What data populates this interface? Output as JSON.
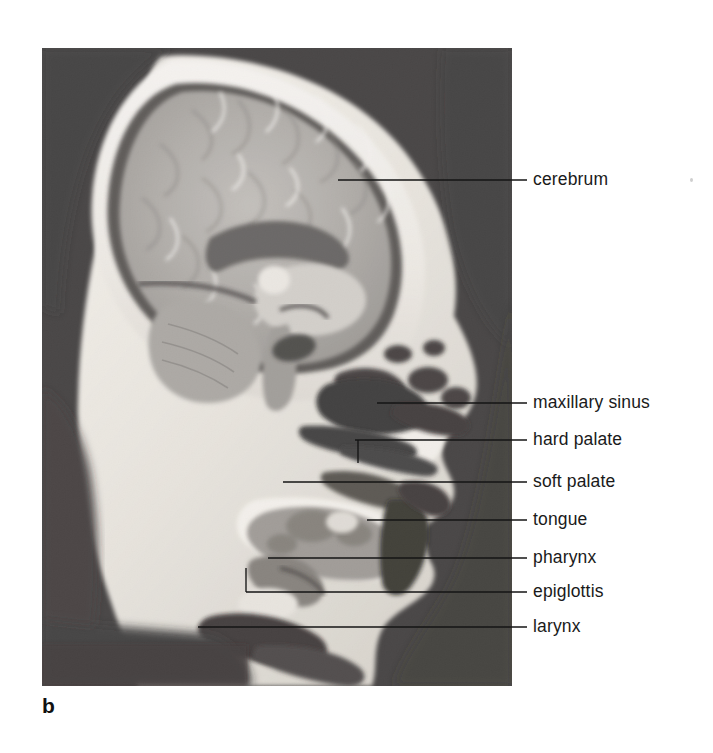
{
  "figure": {
    "panel_letter": "b",
    "caption_present": false,
    "image_kind": "grayscale-photograph",
    "background_color": "#ffffff",
    "ink_color": "#1a1a1a",
    "photo_bounds": {
      "left": 42,
      "top": 48,
      "width": 470,
      "height": 638
    }
  },
  "labels": [
    {
      "key": "cerebrum",
      "text": "cerebrum",
      "text_x": 533,
      "text_y": 170,
      "dash_x1": 512,
      "dash_x2": 527,
      "leader_y": 180,
      "leader_x_start": 338,
      "leader_style": "straight"
    },
    {
      "key": "maxillary-sinus",
      "text": "maxillary sinus",
      "text_x": 533,
      "text_y": 393,
      "dash_x1": 512,
      "dash_x2": 527,
      "leader_y": 403,
      "leader_x_start": 377,
      "leader_style": "straight"
    },
    {
      "key": "hard-palate",
      "text": "hard palate",
      "text_x": 533,
      "text_y": 430,
      "dash_x1": 512,
      "dash_x2": 527,
      "leader_y": 440,
      "leader_x_start": 355,
      "leader_style": "tick-down",
      "tick_x": 358,
      "tick_y_end": 463
    },
    {
      "key": "soft-palate",
      "text": "soft palate",
      "text_x": 533,
      "text_y": 472,
      "dash_x1": 512,
      "dash_x2": 527,
      "leader_y": 482,
      "leader_x_start": 283,
      "leader_style": "straight"
    },
    {
      "key": "tongue",
      "text": "tongue",
      "text_x": 533,
      "text_y": 510,
      "dash_x1": 512,
      "dash_x2": 527,
      "leader_y": 520,
      "leader_x_start": 367,
      "leader_style": "straight"
    },
    {
      "key": "pharynx",
      "text": "pharynx",
      "text_x": 533,
      "text_y": 548,
      "dash_x1": 512,
      "dash_x2": 527,
      "leader_y": 558,
      "leader_x_start": 268,
      "leader_style": "straight"
    },
    {
      "key": "epiglottis",
      "text": "epiglottis",
      "text_x": 533,
      "text_y": 582,
      "dash_x1": 512,
      "dash_x2": 527,
      "leader_y": 592,
      "leader_x_start": 246,
      "leader_style": "elbow-up",
      "elbow_x": 246,
      "elbow_y_top": 568
    },
    {
      "key": "larynx",
      "text": "larynx",
      "text_x": 533,
      "text_y": 617,
      "dash_x1": 512,
      "dash_x2": 527,
      "leader_y": 627,
      "leader_x_start": 198,
      "leader_style": "straight"
    }
  ]
}
